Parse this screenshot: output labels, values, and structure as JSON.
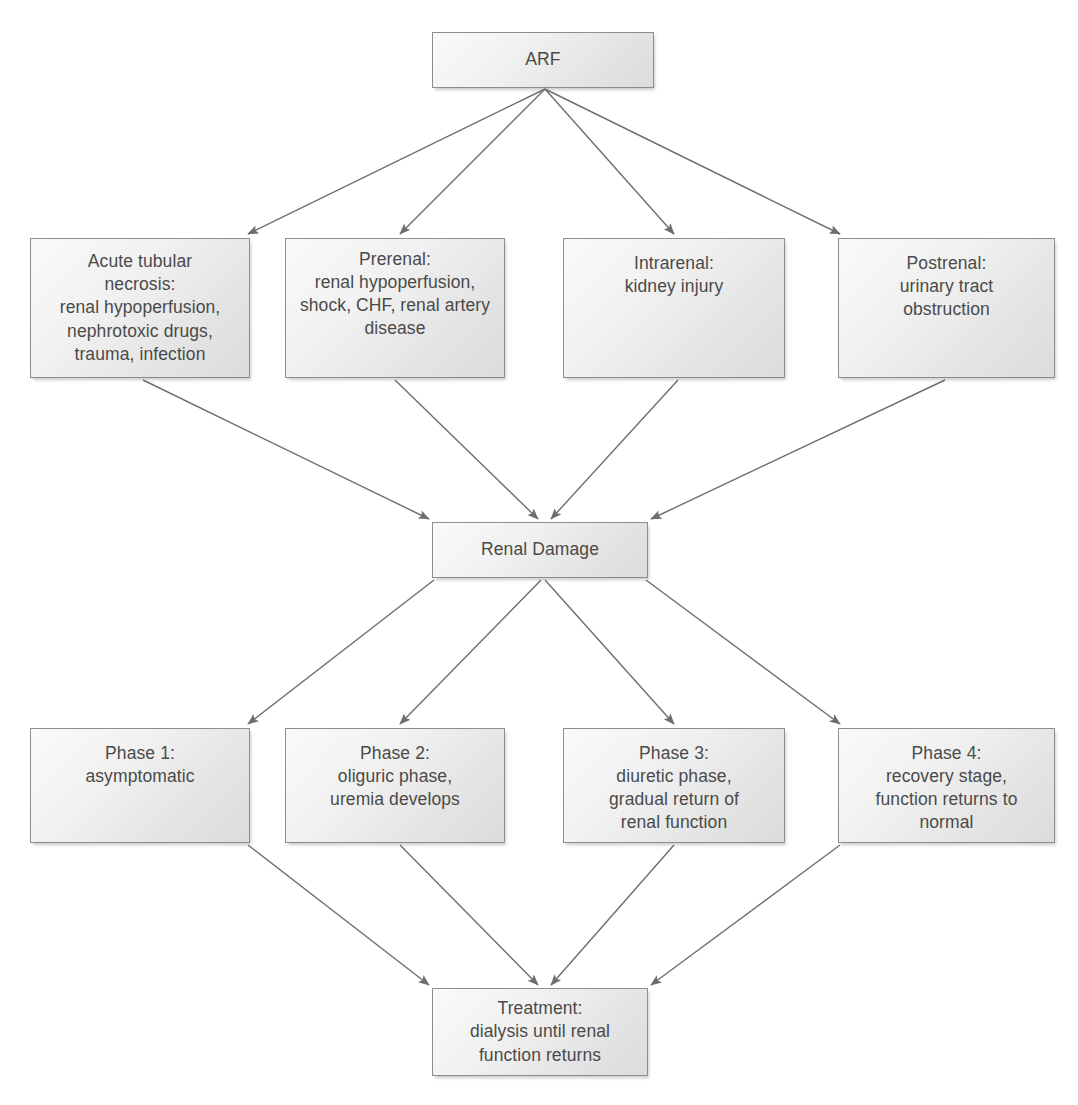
{
  "diagram": {
    "background_color": "#ffffff",
    "node_fill_color": "#e9e9e9",
    "node_border_color": "#8d8d8d",
    "text_color": "#4a4a4a",
    "arrow_color": "#6e6e6e"
  },
  "nodes": {
    "arf": {
      "label": "ARF",
      "x": 432,
      "y": 32,
      "w": 222,
      "h": 56,
      "align": "v-center"
    },
    "cause_atn": {
      "label": "Acute tubular\nnecrosis:\nrenal hypoperfusion,\nnephrotoxic drugs,\ntrauma, infection",
      "x": 30,
      "y": 238,
      "w": 220,
      "h": 140,
      "align": "v-center"
    },
    "cause_prerenal": {
      "label": "Prerenal:\nrenal hypoperfusion,\nshock, CHF, renal artery\ndisease",
      "x": 285,
      "y": 238,
      "w": 220,
      "h": 140,
      "align": "v-upper"
    },
    "cause_intrarenal": {
      "label": "Intrarenal:\nkidney injury",
      "x": 563,
      "y": 238,
      "w": 222,
      "h": 140,
      "align": "v-top"
    },
    "cause_postrenal": {
      "label": "Postrenal:\nurinary tract\nobstruction",
      "x": 838,
      "y": 238,
      "w": 217,
      "h": 140,
      "align": "v-top"
    },
    "renal_damage": {
      "label": "Renal Damage",
      "x": 432,
      "y": 522,
      "w": 216,
      "h": 56,
      "align": "v-center"
    },
    "phase1": {
      "label": "Phase 1:\nasymptomatic",
      "x": 30,
      "y": 728,
      "w": 220,
      "h": 115,
      "align": "v-top"
    },
    "phase2": {
      "label": "Phase 2:\noliguric phase,\nuremia develops",
      "x": 285,
      "y": 728,
      "w": 220,
      "h": 115,
      "align": "v-top"
    },
    "phase3": {
      "label": "Phase 3:\ndiuretic phase,\ngradual return of\nrenal function",
      "x": 563,
      "y": 728,
      "w": 222,
      "h": 115,
      "align": "v-top"
    },
    "phase4": {
      "label": "Phase 4:\nrecovery stage,\nfunction returns to\nnormal",
      "x": 838,
      "y": 728,
      "w": 217,
      "h": 115,
      "align": "v-top"
    },
    "treatment": {
      "label": "Treatment:\ndialysis until renal\nfunction returns",
      "x": 432,
      "y": 988,
      "w": 216,
      "h": 88,
      "align": "v-center"
    }
  },
  "edges": [
    {
      "name": "arf-to-acute-tubular-necrosis",
      "from": "arf",
      "to": "cause_atn",
      "x1": 545,
      "y1": 89,
      "x2": 248,
      "y2": 234
    },
    {
      "name": "arf-to-prerenal",
      "from": "arf",
      "to": "cause_prerenal",
      "x1": 545,
      "y1": 89,
      "x2": 400,
      "y2": 234
    },
    {
      "name": "arf-to-intrarenal",
      "from": "arf",
      "to": "cause_intrarenal",
      "x1": 545,
      "y1": 89,
      "x2": 674,
      "y2": 234
    },
    {
      "name": "arf-to-postrenal",
      "from": "arf",
      "to": "cause_postrenal",
      "x1": 545,
      "y1": 89,
      "x2": 840,
      "y2": 234
    },
    {
      "name": "acute-tubular-necrosis-to-renal-damage",
      "from": "cause_atn",
      "to": "renal_damage",
      "x1": 143,
      "y1": 380,
      "x2": 429,
      "y2": 519
    },
    {
      "name": "prerenal-to-renal-damage",
      "from": "cause_prerenal",
      "to": "renal_damage",
      "x1": 395,
      "y1": 380,
      "x2": 538,
      "y2": 519
    },
    {
      "name": "intrarenal-to-renal-damage",
      "from": "cause_intrarenal",
      "to": "renal_damage",
      "x1": 678,
      "y1": 380,
      "x2": 551,
      "y2": 519
    },
    {
      "name": "postrenal-to-renal-damage",
      "from": "cause_postrenal",
      "to": "renal_damage",
      "x1": 945,
      "y1": 380,
      "x2": 651,
      "y2": 519
    },
    {
      "name": "renal-damage-to-phase-1",
      "from": "renal_damage",
      "to": "phase1",
      "x1": 434,
      "y1": 580,
      "x2": 248,
      "y2": 724
    },
    {
      "name": "renal-damage-to-phase-2",
      "from": "renal_damage",
      "to": "phase2",
      "x1": 541,
      "y1": 580,
      "x2": 400,
      "y2": 724
    },
    {
      "name": "renal-damage-to-phase-3",
      "from": "renal_damage",
      "to": "phase3",
      "x1": 545,
      "y1": 580,
      "x2": 674,
      "y2": 724
    },
    {
      "name": "renal-damage-to-phase-4",
      "from": "renal_damage",
      "to": "phase4",
      "x1": 646,
      "y1": 580,
      "x2": 840,
      "y2": 724
    },
    {
      "name": "phase-1-to-treatment",
      "from": "phase1",
      "to": "treatment",
      "x1": 248,
      "y1": 845,
      "x2": 429,
      "y2": 985
    },
    {
      "name": "phase-2-to-treatment",
      "from": "phase2",
      "to": "treatment",
      "x1": 400,
      "y1": 845,
      "x2": 538,
      "y2": 985
    },
    {
      "name": "phase-3-to-treatment",
      "from": "phase3",
      "to": "treatment",
      "x1": 674,
      "y1": 845,
      "x2": 551,
      "y2": 985
    },
    {
      "name": "phase-4-to-treatment",
      "from": "phase4",
      "to": "treatment",
      "x1": 840,
      "y1": 845,
      "x2": 651,
      "y2": 985
    }
  ]
}
